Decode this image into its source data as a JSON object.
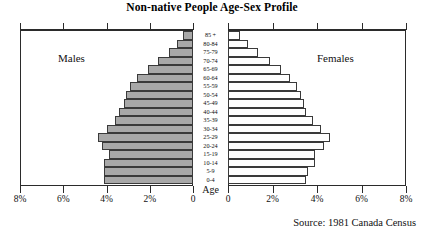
{
  "chart_data": {
    "type": "bar",
    "subtype": "population-pyramid",
    "title": "Non-native People Age-Sex Profile",
    "source": "Source: 1981 Canada Census",
    "xlabel": "",
    "ylabel": "Age",
    "age_axis_title": "Age",
    "left_panel_label": "Males",
    "right_panel_label": "Females",
    "xlim": [
      0,
      8
    ],
    "xunit": "%",
    "grid": false,
    "legend": "none",
    "left_tick_labels": [
      "8%",
      "6%",
      "4%",
      "2%",
      "0"
    ],
    "left_tick_values": [
      8,
      6,
      4,
      2,
      0
    ],
    "right_tick_labels": [
      "0",
      "2%",
      "4%",
      "6%",
      "8%"
    ],
    "right_tick_values": [
      0,
      2,
      4,
      6,
      8
    ],
    "categories": [
      "85 +",
      "80-84",
      "75-79",
      "70-74",
      "65-69",
      "60-64",
      "55-59",
      "50-54",
      "45-49",
      "40-44",
      "35-39",
      "30-34",
      "25-29",
      "20-24",
      "15-19",
      "10-14",
      "5-9",
      "0-4"
    ],
    "series": [
      {
        "name": "Males",
        "color": "#a8a8a8",
        "values": [
          0.45,
          0.75,
          1.1,
          1.6,
          2.1,
          2.6,
          2.9,
          3.1,
          3.2,
          3.4,
          3.6,
          4.0,
          4.4,
          4.2,
          3.9,
          4.1,
          4.1,
          4.1
        ]
      },
      {
        "name": "Females",
        "color": "#ffffff",
        "values": [
          0.55,
          0.9,
          1.35,
          1.9,
          2.4,
          2.8,
          3.1,
          3.3,
          3.4,
          3.5,
          3.8,
          4.2,
          4.6,
          4.3,
          3.9,
          3.9,
          3.6,
          3.5
        ]
      }
    ]
  },
  "header": {
    "title": "Non-native People Age-Sex Profile"
  },
  "footer": {
    "source": "Source: 1981 Canada Census"
  }
}
